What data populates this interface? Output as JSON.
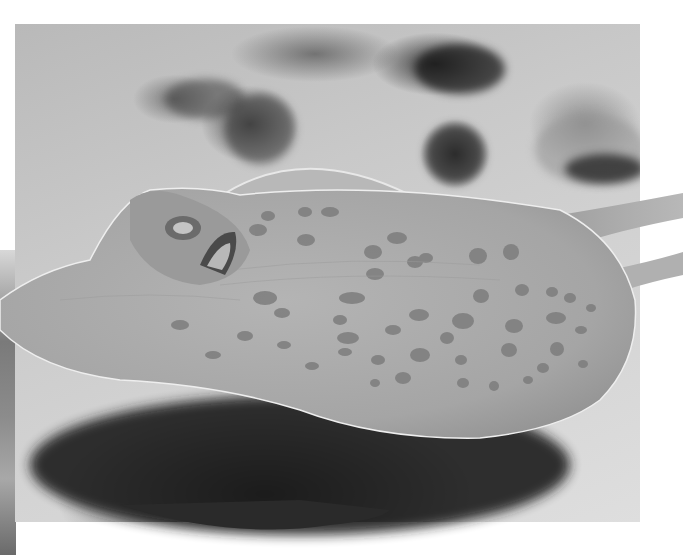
{
  "image": {
    "subject": "Spotted stingray resting on sandy seabed",
    "color_mode": "grayscale",
    "scene_elements": [
      "stingray",
      "sand",
      "rocks",
      "shadow",
      "tail"
    ],
    "colors": {
      "background": "#ffffff",
      "sand": "#cfcfcf",
      "ray_body": "#a9a9a9",
      "ray_spots": "#7d7d7d",
      "shadow": "#2a2a2a",
      "rocks": "#3c3c3c"
    }
  }
}
